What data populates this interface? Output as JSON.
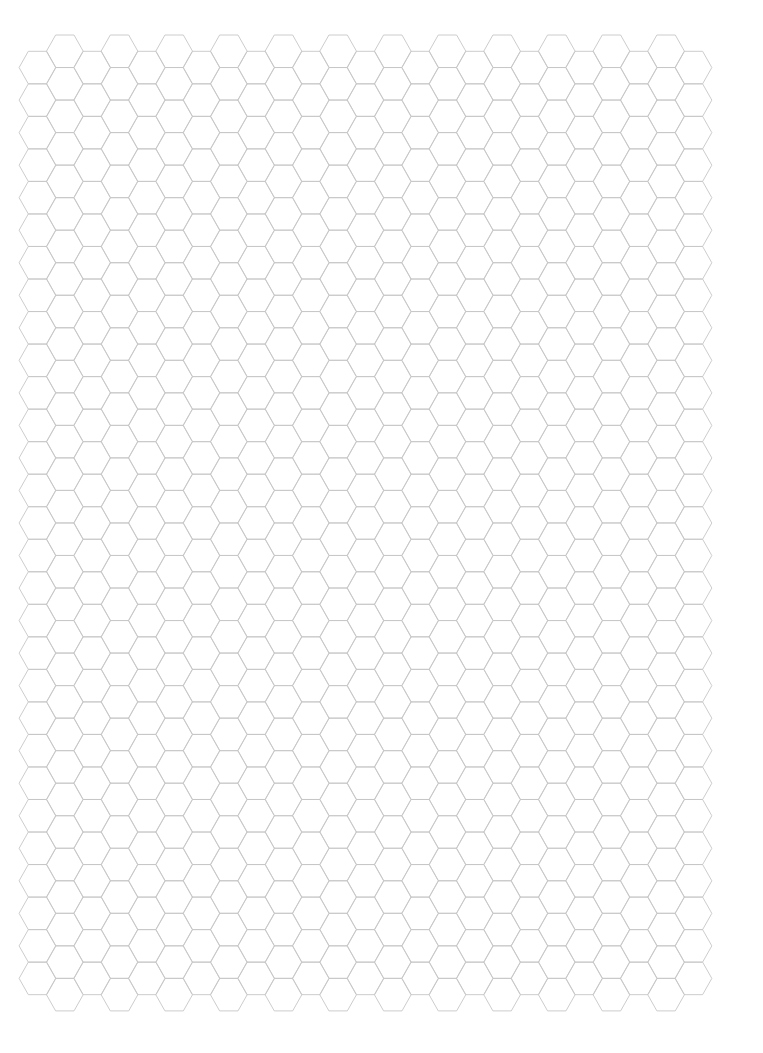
{
  "page": {
    "width": 763,
    "height": 1053,
    "background": "#ffffff"
  },
  "hex_grid": {
    "orientation": "flat-top",
    "columns": 25,
    "odd_column_rows": 30,
    "even_column_rows": 29,
    "first_column_center_x": 37.5,
    "column_step": 27.33,
    "half_width": 18.4,
    "row_pitch": 32.53,
    "odd_column_top_y": 35,
    "even_column_top_y": 51.3,
    "stroke_color": "#c6c6c6",
    "stroke_width": 0.9
  }
}
